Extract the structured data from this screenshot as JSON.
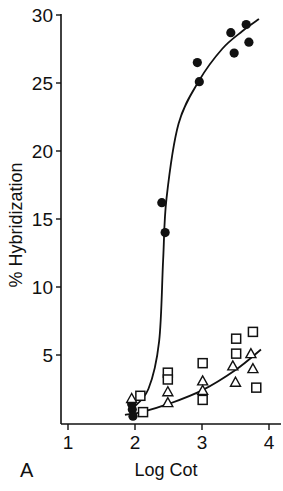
{
  "chart_data": {
    "type": "scatter",
    "title": "",
    "panel_label": "A",
    "xlabel": "Log Cot",
    "ylabel": "% Hybridization",
    "xlim": [
      1,
      4.2
    ],
    "ylim": [
      0,
      30
    ],
    "xticks": [
      1,
      2,
      3,
      4
    ],
    "yticks": [
      5,
      10,
      15,
      20,
      25,
      30
    ],
    "grid": false,
    "legend": null,
    "series": [
      {
        "name": "filled circles",
        "marker": "circle-filled",
        "points": [
          {
            "x": 1.95,
            "y": 1.4
          },
          {
            "x": 1.96,
            "y": 1.0
          },
          {
            "x": 1.97,
            "y": 0.5
          },
          {
            "x": 2.4,
            "y": 16.2
          },
          {
            "x": 2.45,
            "y": 14.0
          },
          {
            "x": 2.93,
            "y": 26.5
          },
          {
            "x": 2.96,
            "y": 25.1
          },
          {
            "x": 3.43,
            "y": 28.7
          },
          {
            "x": 3.48,
            "y": 27.2
          },
          {
            "x": 3.66,
            "y": 29.3
          },
          {
            "x": 3.7,
            "y": 28.0
          }
        ]
      },
      {
        "name": "open squares",
        "marker": "square-open",
        "points": [
          {
            "x": 2.08,
            "y": 2.0
          },
          {
            "x": 2.12,
            "y": 0.8
          },
          {
            "x": 2.49,
            "y": 3.7
          },
          {
            "x": 2.49,
            "y": 3.2
          },
          {
            "x": 3.01,
            "y": 4.4
          },
          {
            "x": 3.01,
            "y": 1.7
          },
          {
            "x": 3.51,
            "y": 6.2
          },
          {
            "x": 3.51,
            "y": 5.1
          },
          {
            "x": 3.76,
            "y": 6.7
          },
          {
            "x": 3.81,
            "y": 2.6
          }
        ]
      },
      {
        "name": "open triangles",
        "marker": "triangle-open",
        "points": [
          {
            "x": 1.95,
            "y": 1.8
          },
          {
            "x": 2.49,
            "y": 2.3
          },
          {
            "x": 2.49,
            "y": 1.5
          },
          {
            "x": 3.01,
            "y": 3.1
          },
          {
            "x": 3.01,
            "y": 2.4
          },
          {
            "x": 3.46,
            "y": 4.2
          },
          {
            "x": 3.5,
            "y": 3.0
          },
          {
            "x": 3.73,
            "y": 5.1
          },
          {
            "x": 3.76,
            "y": 4.0
          }
        ]
      }
    ],
    "curves": [
      {
        "name": "fit curve (filled circles)",
        "points": [
          {
            "x": 1.95,
            "y": 1.0
          },
          {
            "x": 2.2,
            "y": 2.5
          },
          {
            "x": 2.36,
            "y": 6.0
          },
          {
            "x": 2.42,
            "y": 12.0
          },
          {
            "x": 2.47,
            "y": 16.5
          },
          {
            "x": 2.65,
            "y": 22.0
          },
          {
            "x": 2.96,
            "y": 25.2
          },
          {
            "x": 3.3,
            "y": 27.5
          },
          {
            "x": 3.6,
            "y": 28.8
          },
          {
            "x": 3.85,
            "y": 29.7
          }
        ]
      },
      {
        "name": "fit curve (squares/triangles)",
        "points": [
          {
            "x": 1.85,
            "y": 0.6
          },
          {
            "x": 2.1,
            "y": 0.8
          },
          {
            "x": 2.5,
            "y": 1.4
          },
          {
            "x": 3.0,
            "y": 2.4
          },
          {
            "x": 3.5,
            "y": 3.9
          },
          {
            "x": 3.88,
            "y": 5.4
          }
        ]
      }
    ]
  },
  "labels": {
    "panel": "A",
    "x_axis_title": "Log Cot",
    "y_axis_title": "% Hybridization",
    "x_ticks": [
      "1",
      "2",
      "3",
      "4"
    ],
    "y_ticks": [
      "5",
      "10",
      "15",
      "20",
      "25",
      "30"
    ]
  }
}
